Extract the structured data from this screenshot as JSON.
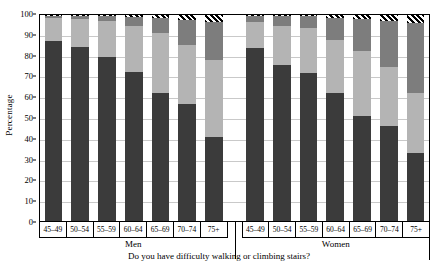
{
  "axes": {
    "ylabel": "Percentage",
    "yticks": [
      0,
      10,
      20,
      30,
      40,
      50,
      60,
      70,
      80,
      90,
      100
    ],
    "caption": "Do you have difficulty walking or climbing stairs?"
  },
  "groups": [
    {
      "name": "Men",
      "categories": [
        "45–49",
        "50–54",
        "55–59",
        "60–64",
        "65–69",
        "70–74",
        "75+"
      ]
    },
    {
      "name": "Women",
      "categories": [
        "45–49",
        "50–54",
        "55–59",
        "60–64",
        "65–69",
        "70–74",
        "75+"
      ]
    }
  ],
  "colors": {
    "segment_0": "#3b3b3b",
    "segment_1": "#b4b4b4",
    "segment_2": "#7d7d7d",
    "segment_3": "#000000",
    "grid": "#c9c9c9",
    "axis": "#000000",
    "background": "#ffffff"
  },
  "chart_data": {
    "type": "bar",
    "stacked": true,
    "percent_stacked": true,
    "title": "",
    "subtitle": "",
    "xlabel": "",
    "ylabel": "Percentage",
    "ylim": [
      0,
      100
    ],
    "ytick_step": 10,
    "grid": true,
    "legend": "none",
    "annotation": "Do you have difficulty walking or climbing stairs?",
    "group_labels": [
      "Men",
      "Women"
    ],
    "categories": [
      "Men 45–49",
      "Men 50–54",
      "Men 55–59",
      "Men 60–64",
      "Men 65–69",
      "Men 70–74",
      "Men 75+",
      "Women 45–49",
      "Women 50–54",
      "Women 55–59",
      "Women 60–64",
      "Women 65–69",
      "Women 70–74",
      "Women 75+"
    ],
    "series": [
      {
        "name": "segment-1",
        "color": "#3b3b3b",
        "values": [
          87.5,
          84.5,
          79.5,
          72.5,
          62.0,
          57.0,
          41.0,
          84.0,
          75.5,
          72.0,
          62.0,
          51.0,
          46.0,
          33.0
        ]
      },
      {
        "name": "segment-2",
        "color": "#b4b4b4",
        "values": [
          11.0,
          13.5,
          17.5,
          22.0,
          29.5,
          28.5,
          37.0,
          12.5,
          19.0,
          21.5,
          26.0,
          31.5,
          29.0,
          29.0
        ]
      },
      {
        "name": "segment-3",
        "color": "#7d7d7d",
        "values": [
          1.2,
          1.7,
          2.4,
          4.5,
          7.0,
          12.0,
          18.5,
          3.0,
          4.8,
          5.8,
          10.5,
          15.5,
          22.0,
          34.0
        ]
      },
      {
        "name": "segment-4",
        "color": "#000000",
        "hatched": true,
        "values": [
          0.3,
          0.3,
          0.6,
          1.0,
          1.5,
          2.5,
          3.5,
          0.5,
          0.7,
          0.7,
          1.5,
          2.0,
          3.0,
          4.0
        ]
      }
    ]
  }
}
